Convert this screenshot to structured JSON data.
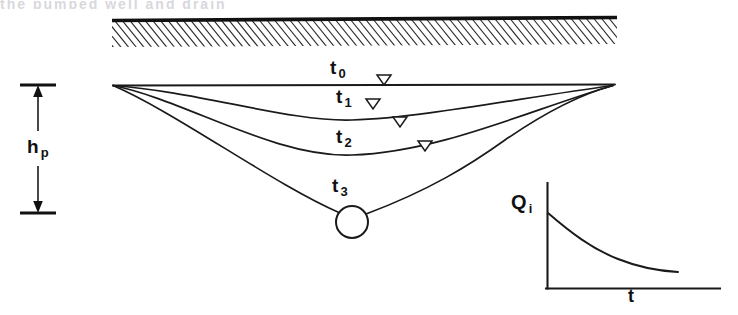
{
  "figure": {
    "domain_label": "hydrogeology-drawdown-diagram",
    "ghost_caption": "   the pumped well and drain",
    "background_color": "#ffffff",
    "line_color": "#1a1a1a"
  },
  "ground": {
    "name": "ground-surface-hatched-band",
    "x_start": 112,
    "x_end": 617,
    "surface_y_left": 20,
    "surface_y_right": 17,
    "band_depth": 26,
    "hatch_count": 74
  },
  "water_table": {
    "name": "initial-water-table",
    "label": "t",
    "subscript": "0",
    "y": 85,
    "x_start": 113,
    "x_end": 615
  },
  "dimension": {
    "name": "h-p-dimension",
    "label": "h",
    "subscript": "p",
    "x": 38,
    "top_y": 85,
    "bottom_y": 213,
    "tick_half_width": 18
  },
  "curves": [
    {
      "name": "drawdown-curve-t0",
      "label": "t",
      "subscript": "0",
      "label_x": 334,
      "label_y": 64,
      "depth": 0,
      "marker_x": 383,
      "marker_y": 79
    },
    {
      "name": "drawdown-curve-t1",
      "label": "t",
      "subscript": "1",
      "label_x": 340,
      "label_y": 92,
      "depth": 30,
      "marker_x": 373,
      "marker_y": 104
    },
    {
      "name": "drawdown-curve-t2",
      "label": "t",
      "subscript": "2",
      "label_x": 340,
      "label_y": 131,
      "depth": 62,
      "marker_x": 399,
      "marker_y": 122
    },
    {
      "name": "drawdown-curve-t3",
      "label": "t",
      "subscript": "3",
      "label_x": 336,
      "label_y": 180,
      "depth": 120,
      "marker_x": 424,
      "marker_y": 146
    }
  ],
  "well": {
    "name": "pumping-well",
    "center_x": 352,
    "center_y": 222,
    "radius": 16
  },
  "inset": {
    "name": "discharge-vs-time-inset",
    "y_label": "Q",
    "y_subscript": "i",
    "x_label": "t",
    "axis_x": 547,
    "axis_top_y": 183,
    "axis_bottom_y": 288,
    "axis_right_x": 720,
    "curve_start_y": 213,
    "curve_end_x": 678,
    "curve_end_y": 272,
    "y_label_x": 514,
    "y_label_y": 200,
    "x_label_x": 630,
    "x_label_y": 291
  },
  "chart_data": {
    "type": "line",
    "title": "",
    "xlabel": "t",
    "ylabel": "Qi",
    "grid": false,
    "legend": "none",
    "series": [
      {
        "name": "Qi",
        "x": [
          0,
          0.1,
          0.2,
          0.3,
          0.4,
          0.5,
          0.6,
          0.7,
          0.8,
          0.9,
          1.0
        ],
        "values": [
          1.0,
          0.78,
          0.62,
          0.5,
          0.42,
          0.35,
          0.3,
          0.26,
          0.23,
          0.21,
          0.2
        ]
      }
    ],
    "annotation": "Well discharge decays with time"
  }
}
